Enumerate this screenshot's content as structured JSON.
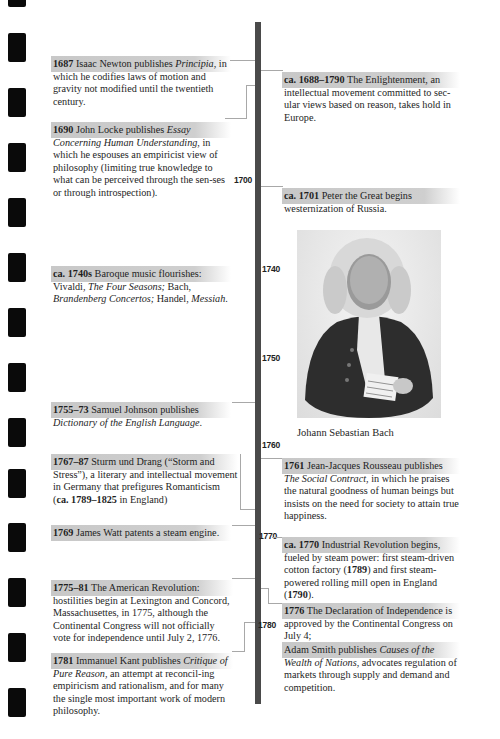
{
  "timeline": {
    "year_markers": [
      {
        "label": "1700",
        "top": 175,
        "left": 234
      },
      {
        "label": "1740",
        "top": 264,
        "left": 262
      },
      {
        "label": "1750",
        "top": 353,
        "left": 262
      },
      {
        "label": "1760",
        "top": 440,
        "left": 262
      },
      {
        "label": "1770",
        "top": 531,
        "left": 259
      },
      {
        "label": "1780",
        "top": 620,
        "left": 258
      }
    ]
  },
  "left_entries": [
    {
      "id": "newton",
      "date": "1687",
      "html": " Isaac Newton publishes <i>Principia</i>, in which he codifies laws of motion and gravity not modified until the twentieth century."
    },
    {
      "id": "locke",
      "date": "1690",
      "html": " John Locke publishes <i>Essay Concerning Human Understanding</i>, in which he espouses an empiricist view of philosophy (limiting true knowledge to what can be perceived through the sen-ses or through introspection)."
    },
    {
      "id": "baroque",
      "date": "ca. 1740s",
      "html": " Baroque music flourishes: Vivaldi, <i>The Four Seasons;</i> Bach, <i>Brandenberg Concertos;</i> Handel, <i>Messiah</i>."
    },
    {
      "id": "johnson",
      "date": "1755–73",
      "html": " Samuel Johnson publishes <i>Dictionary of the English Language</i>."
    },
    {
      "id": "sturm",
      "date": "1767–87",
      "html": " Sturm und Drang (“Storm and Stress”), a literary and intellectual movement in Germany that prefigures Romanticism (<b>ca. 1789–1825</b> in England)"
    },
    {
      "id": "watt",
      "date": "1769",
      "html": " James Watt patents a steam engine."
    },
    {
      "id": "amrev",
      "date": "1775–81",
      "html": " The American Revolution: hostilities begin at Lexington and Concord, Massachusettes, in 1775, although the Continental Congress will not officially vote for independence until July 2, 1776."
    },
    {
      "id": "kant",
      "date": "1781",
      "html": " Immanuel Kant publishes <i>Critique of Pure Reason</i>, an attempt at reconcil-ing empiricism and rationalism, and for many the single most important work of modern philosophy."
    }
  ],
  "right_entries": [
    {
      "id": "enlightenment",
      "date": "ca. 1688–1790",
      "html": " The Enlightenment, an intellectual movement committed to sec-ular views based on reason, takes hold in Europe."
    },
    {
      "id": "peter",
      "date": "ca. 1701",
      "html": " Peter the Great begins westernization of Russia."
    },
    {
      "id": "rousseau",
      "date": "1761",
      "html": " Jean-Jacques Rousseau publishes <i>The Social Contract</i>, in which he praises the natural goodness of human beings but insists on the need for society to attain true happiness."
    },
    {
      "id": "industrial",
      "date": "ca. 1770",
      "html": " Industrial Revolution begins, fueled by steam power: first steam-driven cotton factory (<b>1789</b>) and first steam-powered rolling mill open in England (<b>1790</b>)."
    },
    {
      "id": "declaration",
      "date": "1776",
      "html": " The Declaration of Independence is approved by the Continental Congress on July 4;"
    },
    {
      "id": "smith",
      "date": "",
      "html": "Adam Smith publishes <i>Causes of the Wealth of Nations</i>, advocates regulation of markets through supply and demand and competition."
    }
  ],
  "figure": {
    "caption": "Johann Sebastian Bach",
    "alt": "Portrait engraving of Johann Sebastian Bach holding sheet music"
  },
  "colors": {
    "spine": "#4a4a4a",
    "band": "#c8c8c8",
    "connector": "#a8a8a8",
    "tab": "#0a0a0a"
  }
}
